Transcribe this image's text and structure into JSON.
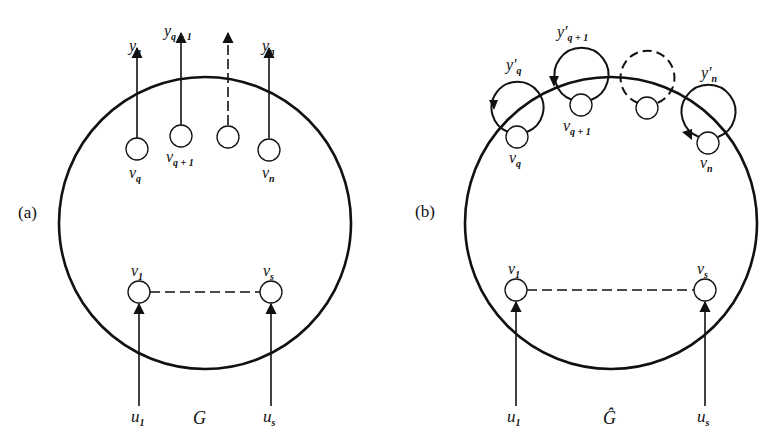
{
  "colors": {
    "ink": "#111111",
    "background": "#ffffff"
  },
  "panel_a": {
    "tag": "(a)",
    "graph_label": "G",
    "outputs": [
      {
        "base": "y",
        "sub": "q"
      },
      {
        "base": "y",
        "sub": "q + 1"
      },
      {
        "base": "",
        "sub": ""
      },
      {
        "base": "y",
        "sub": "n"
      }
    ],
    "output_nodes": [
      {
        "base": "v",
        "sub": "q"
      },
      {
        "base": "v",
        "sub": "q + 1"
      },
      {
        "base": "",
        "sub": ""
      },
      {
        "base": "v",
        "sub": "n"
      }
    ],
    "input_nodes": [
      {
        "base": "v",
        "sub": "1"
      },
      {
        "base": "v",
        "sub": "s"
      }
    ],
    "inputs": [
      {
        "base": "u",
        "sub": "1"
      },
      {
        "base": "u",
        "sub": "s"
      }
    ]
  },
  "panel_b": {
    "tag": "(b)",
    "graph_label": "Ĝ",
    "loop_outputs": [
      {
        "base": "y′",
        "sub": "q"
      },
      {
        "base": "y′",
        "sub": "q + 1"
      },
      {
        "base": "",
        "sub": ""
      },
      {
        "base": "y′",
        "sub": "n"
      }
    ],
    "output_nodes": [
      {
        "base": "v",
        "sub": "q"
      },
      {
        "base": "v",
        "sub": "q + 1"
      },
      {
        "base": "",
        "sub": ""
      },
      {
        "base": "v",
        "sub": "n"
      }
    ],
    "input_nodes": [
      {
        "base": "v",
        "sub": "1"
      },
      {
        "base": "v",
        "sub": "s"
      }
    ],
    "inputs": [
      {
        "base": "u",
        "sub": "1"
      },
      {
        "base": "u",
        "sub": "s"
      }
    ]
  }
}
